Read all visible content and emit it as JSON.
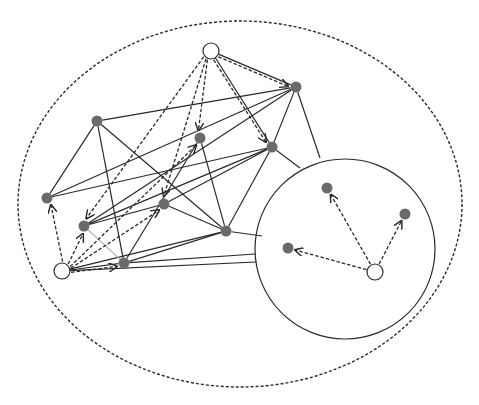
{
  "diagram": {
    "type": "network-graph",
    "width": 479,
    "height": 405,
    "colors": {
      "line": "#2a2a2a",
      "light_line": "#b5b5b5",
      "filled_node": "#6a6a6a",
      "open_node_fill": "#ffffff",
      "background": "#ffffff"
    },
    "regions": [
      {
        "id": "outer-region",
        "shape": "ellipse",
        "cx": 240,
        "cy": 204,
        "rx": 222,
        "ry": 183,
        "style": "dashed"
      },
      {
        "id": "inner-region",
        "shape": "circle",
        "cx": 345,
        "cy": 249,
        "r": 90,
        "style": "solid"
      }
    ],
    "nodes": [
      {
        "id": "S1",
        "kind": "open",
        "x": 211,
        "y": 51,
        "r": 8
      },
      {
        "id": "S2",
        "kind": "open",
        "x": 62,
        "y": 271,
        "r": 8
      },
      {
        "id": "S3",
        "kind": "open",
        "x": 375,
        "y": 272,
        "r": 8
      },
      {
        "id": "A",
        "kind": "filled",
        "x": 97,
        "y": 121,
        "r": 5.5
      },
      {
        "id": "B",
        "kind": "filled",
        "x": 200,
        "y": 138,
        "r": 5.5
      },
      {
        "id": "C",
        "kind": "filled",
        "x": 164,
        "y": 204,
        "r": 5.5
      },
      {
        "id": "D",
        "kind": "filled",
        "x": 296,
        "y": 87,
        "r": 5.5
      },
      {
        "id": "E",
        "kind": "filled",
        "x": 272,
        "y": 147,
        "r": 5.5
      },
      {
        "id": "F",
        "kind": "filled",
        "x": 47,
        "y": 198,
        "r": 5.5
      },
      {
        "id": "G",
        "kind": "filled",
        "x": 84,
        "y": 226,
        "r": 5.5
      },
      {
        "id": "H",
        "kind": "filled",
        "x": 124,
        "y": 263,
        "r": 5.5
      },
      {
        "id": "I",
        "kind": "filled",
        "x": 226,
        "y": 231,
        "r": 5.5
      },
      {
        "id": "J",
        "kind": "filled",
        "x": 327,
        "y": 188,
        "r": 5.5
      },
      {
        "id": "K",
        "kind": "filled",
        "x": 405,
        "y": 214,
        "r": 5.5
      },
      {
        "id": "L",
        "kind": "filled",
        "x": 288,
        "y": 248,
        "r": 5.5
      }
    ],
    "solid_edges": [
      [
        "A",
        "F"
      ],
      [
        "A",
        "H"
      ],
      [
        "A",
        "I"
      ],
      [
        "A",
        "D"
      ],
      [
        "F",
        "D"
      ],
      [
        "F",
        "E"
      ],
      [
        "B",
        "I"
      ],
      [
        "B",
        "H"
      ],
      [
        "D",
        "E"
      ],
      [
        "D",
        "G"
      ],
      [
        "E",
        "I"
      ],
      [
        "E",
        "C"
      ],
      [
        "E",
        "G"
      ],
      [
        "C",
        "G"
      ],
      [
        "C",
        "I"
      ],
      [
        "I",
        "H"
      ],
      [
        "S2",
        "H"
      ],
      [
        "S2",
        "I"
      ],
      [
        "S1",
        "D"
      ],
      [
        "S1",
        "E"
      ]
    ],
    "light_edges": [
      [
        "G",
        "H"
      ]
    ],
    "boundary_edges": [
      {
        "from": "D",
        "to": [
          320,
          158
        ]
      },
      {
        "from": "E",
        "to": [
          300,
          168
        ]
      },
      {
        "from": "I",
        "to": [
          262,
          236
        ]
      },
      {
        "from": "H",
        "to": [
          255,
          254
        ]
      },
      {
        "from": "S2",
        "to": [
          256,
          262
        ]
      }
    ],
    "dashed_arrows": [
      [
        "S1",
        "B"
      ],
      [
        "S1",
        "C"
      ],
      [
        "S1",
        "G"
      ],
      [
        "S1",
        "D"
      ],
      [
        "S1",
        "E"
      ],
      [
        "S1",
        "C2"
      ],
      [
        "S2",
        "F"
      ],
      [
        "S2",
        "G"
      ],
      [
        "S2",
        "B"
      ],
      [
        "S2",
        "C"
      ],
      [
        "S2",
        "H"
      ],
      [
        "S3",
        "J"
      ],
      [
        "S3",
        "K"
      ],
      [
        "S3",
        "L"
      ]
    ]
  }
}
